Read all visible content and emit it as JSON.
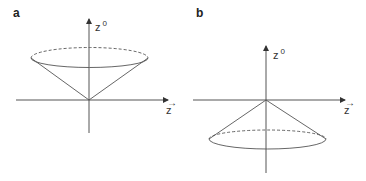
{
  "figure": {
    "panels": [
      {
        "label": "a",
        "vertical_axis_label": "z",
        "vertical_axis_superscript": "0",
        "horizontal_axis_label": "z",
        "horizontal_axis_arrow": "→",
        "cone_direction": "future (opening upward)"
      },
      {
        "label": "b",
        "vertical_axis_label": "z",
        "vertical_axis_superscript": "0",
        "horizontal_axis_label": "z",
        "horizontal_axis_arrow": "→",
        "cone_direction": "past (opening downward)"
      }
    ],
    "colors": {
      "line": "#555555",
      "text": "#333333"
    }
  }
}
